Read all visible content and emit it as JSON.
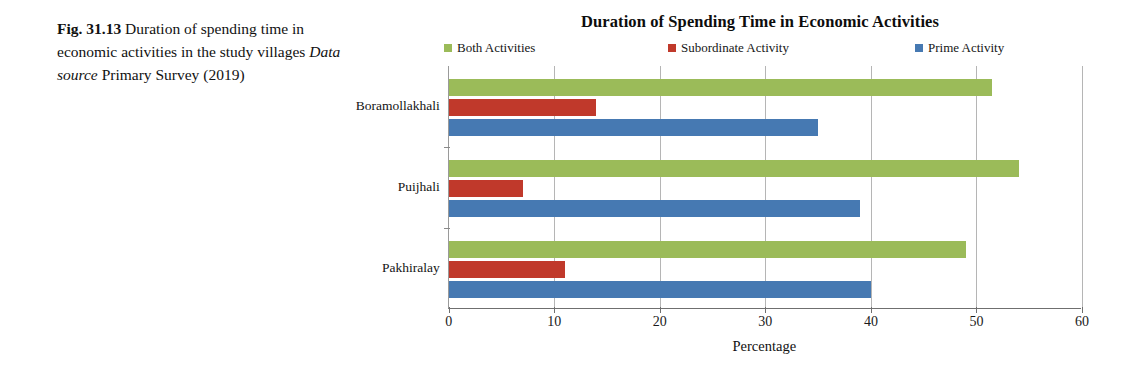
{
  "caption": {
    "fig_number": "Fig. 31.13",
    "text": "Duration of spending time in economic activities in the study villages",
    "source_label": "Data source",
    "source_text": "Primary Survey (2019)"
  },
  "chart_data": {
    "type": "bar",
    "orientation": "horizontal",
    "title": "Duration of Spending Time in Economic Activities",
    "xlabel": "Percentage",
    "ylabel": "",
    "categories": [
      "Boramollakhali",
      "Puijhali",
      "Pakhiralay"
    ],
    "series": [
      {
        "name": "Both Activities",
        "color": "#9BBB59",
        "values": [
          51.5,
          54.0,
          49.0
        ]
      },
      {
        "name": "Subordinate Activity",
        "color": "#C0392B",
        "values": [
          14.0,
          7.0,
          11.0
        ]
      },
      {
        "name": "Prime Activity",
        "color": "#4679B2",
        "values": [
          35.0,
          39.0,
          40.0
        ]
      }
    ],
    "xlim": [
      0,
      60
    ],
    "xticks": [
      0,
      10,
      20,
      30,
      40,
      50,
      60
    ],
    "grid": true,
    "legend_position": "top"
  }
}
